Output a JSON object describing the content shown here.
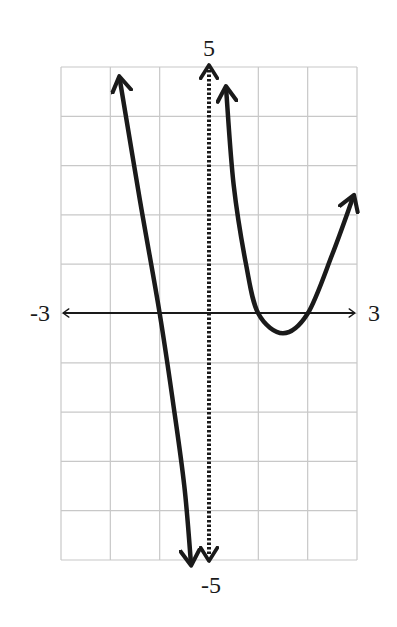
{
  "chart_data": {
    "type": "line",
    "title": "",
    "xlabel": "",
    "ylabel": "",
    "xlim": [
      -3,
      3
    ],
    "ylim": [
      -5,
      5
    ],
    "grid": true,
    "grid_step": 1,
    "axis_labels": {
      "x_min": "-3",
      "x_max": "3",
      "y_max": "5",
      "y_min": "-5"
    },
    "asymptotes": [
      {
        "type": "vertical",
        "x": 0,
        "style": "dotted"
      }
    ],
    "series": [
      {
        "name": "left-branch",
        "points": [
          [
            -1.8,
            4.7
          ],
          [
            -1.4,
            2.3
          ],
          [
            -1.0,
            0
          ],
          [
            -0.73,
            -1.8
          ],
          [
            -0.5,
            -3.5
          ],
          [
            -0.37,
            -5.0
          ]
        ],
        "arrows": [
          "start",
          "end"
        ]
      },
      {
        "name": "right-branch",
        "points": [
          [
            0.35,
            4.5
          ],
          [
            0.5,
            2.6
          ],
          [
            0.75,
            1.0
          ],
          [
            1.0,
            0
          ],
          [
            1.5,
            -0.4
          ],
          [
            2.0,
            0
          ],
          [
            2.5,
            1.2
          ],
          [
            2.9,
            2.3
          ]
        ],
        "arrows": [
          "start",
          "end"
        ]
      }
    ],
    "colors": {
      "curve": "#1a1a1a",
      "grid": "#c8c8c8",
      "axis": "#1a1a1a"
    }
  }
}
